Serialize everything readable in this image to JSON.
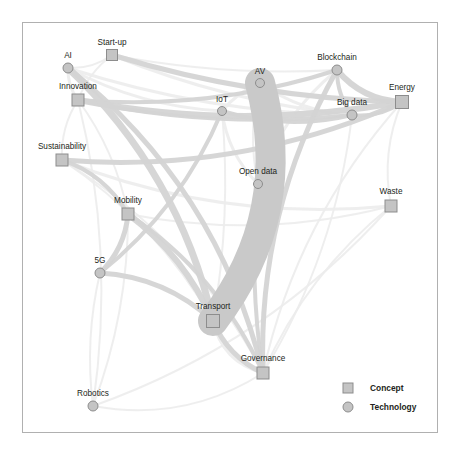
{
  "figure": {
    "frame": {
      "x": 22,
      "y": 22,
      "width": 415,
      "height": 410,
      "stroke": "#b0b0b0"
    },
    "background": "#ffffff"
  },
  "legend": {
    "items": [
      {
        "label": "Concept",
        "shape": "square",
        "color": "#c4c4c4"
      },
      {
        "label": "Technology",
        "shape": "circle",
        "color": "#c4c4c4"
      }
    ],
    "x": 348,
    "y": 388
  },
  "colors": {
    "node_fill": "#c4c4c4",
    "node_stroke": "#8d8d8d",
    "edge_strong": "#c9c9c9",
    "edge_medium": "#d4d4d4",
    "edge_faint": "#ececec",
    "label_text": "#231f20",
    "frame": "#b0b0b0"
  },
  "chart_data": {
    "type": "scatter",
    "title": "",
    "xlabel": "",
    "ylabel": "",
    "network": true,
    "node_categories": [
      "Concept",
      "Technology"
    ],
    "nodes": [
      {
        "id": "start-up",
        "label": "Start-up",
        "type": "Concept",
        "shape": "square",
        "x": 112,
        "y": 55,
        "size": 11,
        "label_dx": 0,
        "label_dy": -10
      },
      {
        "id": "ai",
        "label": "AI",
        "type": "Technology",
        "shape": "circle",
        "x": 68,
        "y": 68,
        "size": 10,
        "label_dx": 0,
        "label_dy": -10
      },
      {
        "id": "innovation",
        "label": "Innovation",
        "type": "Concept",
        "shape": "square",
        "x": 78,
        "y": 100,
        "size": 12,
        "label_dx": 0,
        "label_dy": -11
      },
      {
        "id": "blockchain",
        "label": "Blockchain",
        "type": "Technology",
        "shape": "circle",
        "x": 337,
        "y": 70,
        "size": 10,
        "label_dx": 0,
        "label_dy": -10
      },
      {
        "id": "av",
        "label": "AV",
        "type": "Technology",
        "shape": "circle",
        "x": 260,
        "y": 83,
        "size": 9,
        "label_dx": 0,
        "label_dy": -9
      },
      {
        "id": "energy",
        "label": "Energy",
        "type": "Concept",
        "shape": "square",
        "x": 402,
        "y": 102,
        "size": 13,
        "label_dx": 0,
        "label_dy": -12
      },
      {
        "id": "big-data",
        "label": "Big data",
        "type": "Technology",
        "shape": "circle",
        "x": 352,
        "y": 115,
        "size": 10,
        "label_dx": 0,
        "label_dy": -10
      },
      {
        "id": "iot",
        "label": "IoT",
        "type": "Technology",
        "shape": "circle",
        "x": 222,
        "y": 111,
        "size": 9,
        "label_dx": 0,
        "label_dy": -9
      },
      {
        "id": "sustainability",
        "label": "Sustainability",
        "type": "Concept",
        "shape": "square",
        "x": 62,
        "y": 160,
        "size": 12,
        "label_dx": 0,
        "label_dy": -11
      },
      {
        "id": "open-data",
        "label": "Open data",
        "type": "Technology",
        "shape": "circle",
        "x": 258,
        "y": 184,
        "size": 9,
        "label_dx": 0,
        "label_dy": -10
      },
      {
        "id": "waste",
        "label": "Waste",
        "type": "Concept",
        "shape": "square",
        "x": 391,
        "y": 206,
        "size": 12,
        "label_dx": 0,
        "label_dy": -12
      },
      {
        "id": "mobility",
        "label": "Mobility",
        "type": "Concept",
        "shape": "square",
        "x": 128,
        "y": 214,
        "size": 12,
        "label_dx": 0,
        "label_dy": -11
      },
      {
        "id": "5g",
        "label": "5G",
        "type": "Technology",
        "shape": "circle",
        "x": 100,
        "y": 273,
        "size": 10,
        "label_dx": 0,
        "label_dy": -10
      },
      {
        "id": "transport",
        "label": "Transport",
        "type": "Concept",
        "shape": "square",
        "x": 213,
        "y": 321,
        "size": 13,
        "label_dx": 0,
        "label_dy": -12
      },
      {
        "id": "governance",
        "label": "Governance",
        "type": "Concept",
        "shape": "square",
        "x": 263,
        "y": 373,
        "size": 12,
        "label_dx": 0,
        "label_dy": -12
      },
      {
        "id": "robotics",
        "label": "Robotics",
        "type": "Technology",
        "shape": "circle",
        "x": 93,
        "y": 406,
        "size": 10,
        "label_dx": 0,
        "label_dy": -10
      }
    ],
    "edges": [
      {
        "source": "av",
        "target": "transport",
        "weight": 30,
        "curve": -60
      },
      {
        "source": "transport",
        "target": "governance",
        "weight": 5,
        "curve": 14
      },
      {
        "source": "transport",
        "target": "governance",
        "weight": 3,
        "curve": 22
      },
      {
        "source": "ai",
        "target": "transport",
        "weight": 7,
        "curve": -44
      },
      {
        "source": "ai",
        "target": "governance",
        "weight": 5,
        "curve": -62
      },
      {
        "source": "innovation",
        "target": "energy",
        "weight": 6,
        "curve": 30
      },
      {
        "source": "innovation",
        "target": "blockchain",
        "weight": 4,
        "curve": 26
      },
      {
        "source": "innovation",
        "target": "big-data",
        "weight": 4,
        "curve": 22
      },
      {
        "source": "start-up",
        "target": "energy",
        "weight": 5,
        "curve": 20
      },
      {
        "source": "start-up",
        "target": "big-data",
        "weight": 3,
        "curve": 18
      },
      {
        "source": "sustainability",
        "target": "energy",
        "weight": 5,
        "curve": 44
      },
      {
        "source": "sustainability",
        "target": "mobility",
        "weight": 4,
        "curve": -16
      },
      {
        "source": "sustainability",
        "target": "waste",
        "weight": 3,
        "curve": 40
      },
      {
        "source": "mobility",
        "target": "transport",
        "weight": 6,
        "curve": -18
      },
      {
        "source": "mobility",
        "target": "governance",
        "weight": 4,
        "curve": -30
      },
      {
        "source": "5g",
        "target": "mobility",
        "weight": 5,
        "curve": 12
      },
      {
        "source": "5g",
        "target": "transport",
        "weight": 5,
        "curve": -22
      },
      {
        "source": "5g",
        "target": "iot",
        "weight": 4,
        "curve": 26
      },
      {
        "source": "blockchain",
        "target": "energy",
        "weight": 6,
        "curve": 16
      },
      {
        "source": "blockchain",
        "target": "big-data",
        "weight": 4,
        "curve": 8
      },
      {
        "source": "big-data",
        "target": "energy",
        "weight": 4,
        "curve": 10
      },
      {
        "source": "blockchain",
        "target": "governance",
        "weight": 5,
        "curve": 44
      },
      {
        "source": "open-data",
        "target": "governance",
        "weight": 4,
        "curve": 12
      },
      {
        "source": "open-data",
        "target": "blockchain",
        "weight": 3,
        "curve": -20
      },
      {
        "source": "iot",
        "target": "big-data",
        "weight": 4,
        "curve": 18
      },
      {
        "source": "iot",
        "target": "open-data",
        "weight": 3,
        "curve": 14
      },
      {
        "source": "robotics",
        "target": "mobility",
        "weight": 2,
        "curve": 18
      },
      {
        "source": "robotics",
        "target": "innovation",
        "weight": 2,
        "curve": 30
      },
      {
        "source": "robotics",
        "target": "governance",
        "weight": 2,
        "curve": 34
      },
      {
        "source": "robotics",
        "target": "waste",
        "weight": 2,
        "curve": 46
      },
      {
        "source": "ai",
        "target": "innovation",
        "weight": 3,
        "curve": 6
      },
      {
        "source": "ai",
        "target": "start-up",
        "weight": 2,
        "curve": 8
      },
      {
        "source": "ai",
        "target": "big-data",
        "weight": 3,
        "curve": 22
      },
      {
        "source": "ai",
        "target": "iot",
        "weight": 3,
        "curve": 18
      },
      {
        "source": "innovation",
        "target": "sustainability",
        "weight": 2,
        "curve": 10
      },
      {
        "source": "innovation",
        "target": "mobility",
        "weight": 2,
        "curve": -14
      },
      {
        "source": "energy",
        "target": "waste",
        "weight": 2,
        "curve": 16
      },
      {
        "source": "energy",
        "target": "governance",
        "weight": 2,
        "curve": 40
      },
      {
        "source": "waste",
        "target": "governance",
        "weight": 2,
        "curve": 26
      },
      {
        "source": "open-data",
        "target": "transport",
        "weight": 3,
        "curve": -16
      },
      {
        "source": "iot",
        "target": "transport",
        "weight": 2,
        "curve": -14
      },
      {
        "source": "start-up",
        "target": "innovation",
        "weight": 2,
        "curve": 8
      },
      {
        "source": "5g",
        "target": "robotics",
        "weight": 2,
        "curve": 12
      },
      {
        "source": "sustainability",
        "target": "transport",
        "weight": 2,
        "curve": -26
      },
      {
        "source": "sustainability",
        "target": "governance",
        "weight": 2,
        "curve": -40
      },
      {
        "source": "start-up",
        "target": "blockchain",
        "weight": 2,
        "curve": 14
      },
      {
        "source": "mobility",
        "target": "waste",
        "weight": 2,
        "curve": 30
      },
      {
        "source": "av",
        "target": "iot",
        "weight": 3,
        "curve": 6
      },
      {
        "source": "av",
        "target": "open-data",
        "weight": 2,
        "curve": 12
      },
      {
        "source": "av",
        "target": "big-data",
        "weight": 3,
        "curve": 14
      },
      {
        "source": "governance",
        "target": "big-data",
        "weight": 2,
        "curve": 30
      }
    ]
  }
}
